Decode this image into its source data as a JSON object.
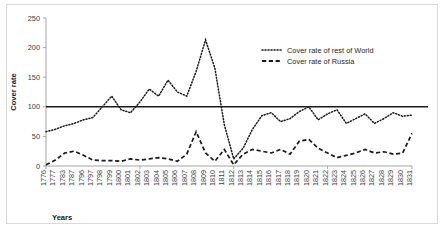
{
  "chart_data": {
    "type": "line",
    "title": "",
    "xlabel": "Years",
    "ylabel": "Cover rate",
    "ylim": [
      0,
      250
    ],
    "yticks": [
      0,
      50,
      100,
      150,
      200,
      250
    ],
    "grid": false,
    "legend_position": "top-right",
    "reference_line": {
      "value": 100,
      "style": "solid",
      "color": "#1a1a1a"
    },
    "categories": [
      "1776",
      "1777",
      "1783",
      "1787",
      "1796",
      "1797",
      "1798",
      "1799",
      "1800",
      "1801",
      "1802",
      "1803",
      "1804",
      "1805",
      "1806",
      "1807",
      "1808",
      "1809",
      "1810",
      "1811",
      "1812",
      "1813",
      "1814",
      "1815",
      "1816",
      "1817",
      "1818",
      "1819",
      "1820",
      "1821",
      "1822",
      "1823",
      "1824",
      "1825",
      "1826",
      "1827",
      "1828",
      "1829",
      "1830",
      "1831"
    ],
    "series": [
      {
        "name": "Cover rate of rest of World",
        "style": "dotted",
        "color": "#1a1a1a",
        "values": [
          58,
          62,
          68,
          72,
          78,
          82,
          100,
          118,
          95,
          90,
          108,
          130,
          118,
          145,
          125,
          118,
          160,
          213,
          165,
          70,
          12,
          30,
          62,
          85,
          90,
          75,
          80,
          92,
          100,
          78,
          88,
          95,
          72,
          80,
          88,
          72,
          80,
          90,
          84,
          86
        ]
      },
      {
        "name": "Cover rate of Russia",
        "style": "dashed",
        "color": "#1a1a1a",
        "values": [
          2,
          10,
          22,
          25,
          18,
          10,
          9,
          9,
          8,
          12,
          10,
          12,
          14,
          12,
          8,
          20,
          58,
          22,
          8,
          28,
          2,
          20,
          28,
          25,
          22,
          28,
          20,
          42,
          45,
          30,
          22,
          14,
          18,
          22,
          28,
          22,
          24,
          20,
          22,
          55
        ]
      }
    ]
  },
  "legend": {
    "items": [
      {
        "label": "Cover rate of rest of World",
        "marker": "dotted-line-marker"
      },
      {
        "label": "Cover rate of Russia",
        "marker": "dashed-line-marker"
      }
    ]
  },
  "axes": {
    "y_title": "Cover rate",
    "x_title": "Years"
  }
}
